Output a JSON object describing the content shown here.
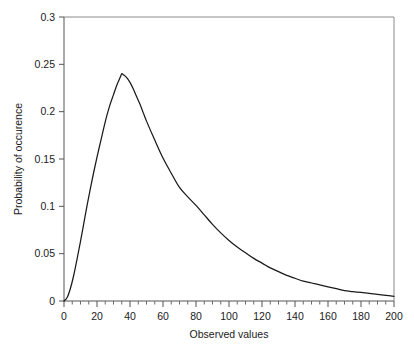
{
  "chart_data": {
    "type": "line",
    "title": "",
    "xlabel": "Observed values",
    "ylabel": "Probability of occurence",
    "xlim": [
      0,
      200
    ],
    "ylim": [
      0,
      0.3
    ],
    "grid": false,
    "legend": false,
    "legend_position": "none",
    "x_major_ticks": [
      0,
      20,
      40,
      60,
      80,
      100,
      120,
      140,
      160,
      180,
      200
    ],
    "x_tick_labels": [
      "0",
      "20",
      "40",
      "60",
      "80",
      "100",
      "120",
      "140",
      "160",
      "180",
      "200"
    ],
    "x_minor_tick_step": 5,
    "y_major_ticks": [
      0,
      0.05,
      0.1,
      0.15,
      0.2,
      0.25,
      0.3
    ],
    "y_tick_labels": [
      "0",
      "0.05",
      "0.1",
      "0.15",
      "0.2",
      "0.25",
      "0.3"
    ],
    "curve_color": "#1a1a1a",
    "frame_color": "#8a8a8a",
    "background_color": "#ffffff",
    "peak": {
      "x": 35,
      "y": 0.24
    },
    "series": [
      {
        "name": "Probability density",
        "x": [
          0,
          2,
          4,
          6,
          8,
          10,
          12,
          14,
          16,
          18,
          20,
          22,
          24,
          26,
          28,
          30,
          32,
          34,
          35,
          36,
          38,
          40,
          42,
          44,
          46,
          48,
          50,
          55,
          60,
          65,
          70,
          75,
          80,
          85,
          90,
          95,
          100,
          105,
          110,
          115,
          120,
          125,
          130,
          135,
          140,
          145,
          150,
          155,
          160,
          165,
          170,
          175,
          180,
          185,
          190,
          195,
          200
        ],
        "values": [
          0.0,
          0.004,
          0.014,
          0.028,
          0.045,
          0.063,
          0.082,
          0.101,
          0.119,
          0.136,
          0.152,
          0.167,
          0.182,
          0.196,
          0.208,
          0.218,
          0.228,
          0.236,
          0.24,
          0.239,
          0.236,
          0.231,
          0.224,
          0.216,
          0.208,
          0.199,
          0.19,
          0.17,
          0.151,
          0.135,
          0.12,
          0.11,
          0.101,
          0.091,
          0.081,
          0.072,
          0.064,
          0.057,
          0.051,
          0.045,
          0.04,
          0.035,
          0.031,
          0.027,
          0.024,
          0.021,
          0.019,
          0.017,
          0.015,
          0.013,
          0.011,
          0.01,
          0.009,
          0.008,
          0.007,
          0.006,
          0.005
        ]
      }
    ]
  }
}
